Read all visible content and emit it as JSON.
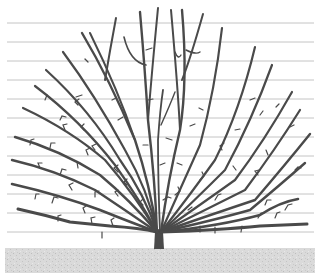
{
  "illustration": {
    "subject": "fan-trained tree on horizontal support wires",
    "colors": {
      "background": "#ffffff",
      "branch": "#4a4a4a",
      "wire": "#c4c4c4",
      "ground": "#d6d6d6"
    },
    "wires_y": [
      23,
      42,
      61,
      80,
      99,
      118,
      137,
      156,
      175,
      194,
      213,
      232
    ],
    "wire_x_range": [
      7,
      314
    ],
    "trunk": {
      "x": 159,
      "top": 226,
      "bottom": 249,
      "width": 9
    },
    "ground": {
      "top": 248,
      "bottom": 273
    }
  }
}
